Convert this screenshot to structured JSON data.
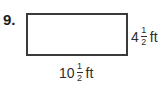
{
  "problem": {
    "number": "9.",
    "shape": "rectangle",
    "height": {
      "whole": "4",
      "numerator": "1",
      "denominator": "2",
      "unit": "ft"
    },
    "width": {
      "whole": "10",
      "numerator": "1",
      "denominator": "2",
      "unit": "ft"
    }
  }
}
